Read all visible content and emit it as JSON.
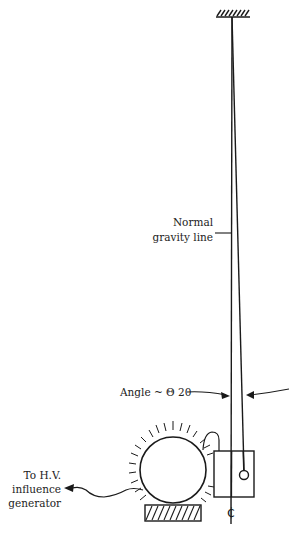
{
  "figure": {
    "type": "diagram"
  },
  "labels": {
    "gravity_line_line1": "Normal",
    "gravity_line_line2": "gravity line",
    "angle": "Angle ~ Θ 20",
    "generator_line1": "To H.V.",
    "generator_line2": "influence",
    "generator_line3": "generator",
    "centerline_symbol": "₵"
  },
  "colors": {
    "ink": "#1a1a1a",
    "background": "#ffffff"
  }
}
